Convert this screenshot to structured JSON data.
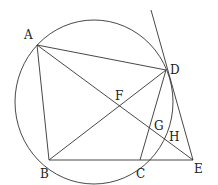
{
  "diagram": {
    "type": "geometry-figure",
    "points": {
      "A": {
        "label": "A",
        "x": 37,
        "y": 45
      },
      "B": {
        "label": "B",
        "x": 49,
        "y": 160
      },
      "C": {
        "label": "C",
        "x": 140,
        "y": 160
      },
      "D": {
        "label": "D",
        "x": 166,
        "y": 70
      },
      "E": {
        "label": "E",
        "x": 193,
        "y": 160
      },
      "F": {
        "label": "F",
        "x": 119,
        "y": 107
      },
      "G": {
        "label": "G",
        "x": 150,
        "y": 129
      },
      "H": {
        "label": "H",
        "x": 163,
        "y": 137
      }
    },
    "circle": {
      "cx": 94,
      "cy": 102,
      "rx": 79,
      "ry": 82
    },
    "segments": [
      [
        "A",
        "B"
      ],
      [
        "A",
        "D"
      ],
      [
        "A",
        "E"
      ],
      [
        "B",
        "D"
      ],
      [
        "B",
        "E"
      ],
      [
        "C",
        "D"
      ],
      [
        "D",
        "E"
      ]
    ],
    "tangent_line": {
      "from": [
        151,
        10
      ],
      "to": [
        193,
        160
      ]
    },
    "stroke_color": "#333333"
  }
}
